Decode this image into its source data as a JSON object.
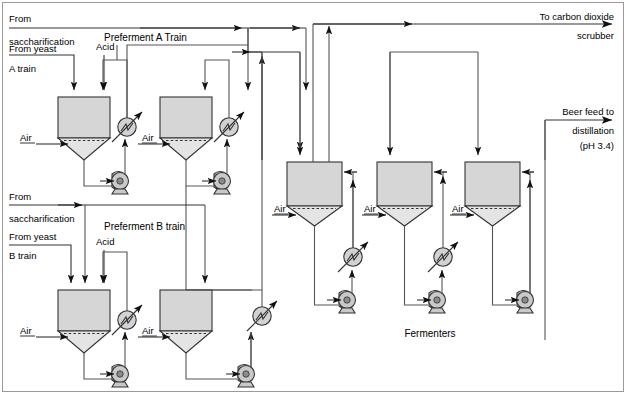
{
  "diagram": {
    "accent_color": "#d6d6d6",
    "line_color": "#555555",
    "outline_color": "#333333"
  },
  "labels": {
    "from_saccharification_a_1": "From",
    "from_saccharification_a_2": "saccharification",
    "from_yeast_a_1": "From yeast",
    "from_yeast_a_2": "A train",
    "acid_a": "Acid",
    "preferment_a_title": "Preferment A Train",
    "from_saccharification_b_1": "From",
    "from_saccharification_b_2": "saccharification",
    "from_yeast_b_1": "From yeast",
    "from_yeast_b_2": "B train",
    "acid_b": "Acid",
    "preferment_b_title": "Preferment B train",
    "to_co2_1": "To carbon dioxide",
    "to_co2_2": "scrubber",
    "beer_feed_1": "Beer feed to",
    "beer_feed_2": "distillation",
    "beer_feed_3": "(pH 3.4)",
    "fermenters": "Fermenters",
    "air": "Air"
  },
  "air_inlets": [
    {
      "id": "air-preferment-a1",
      "label": "Air"
    },
    {
      "id": "air-preferment-a2",
      "label": "Air"
    },
    {
      "id": "air-preferment-b1",
      "label": "Air"
    },
    {
      "id": "air-preferment-b2",
      "label": "Air"
    },
    {
      "id": "air-fermenter-1",
      "label": "Air"
    },
    {
      "id": "air-fermenter-2",
      "label": "Air"
    },
    {
      "id": "air-fermenter-3",
      "label": "Air"
    }
  ],
  "vessels": [
    {
      "id": "preferment-a-1",
      "kind": "preferment",
      "train": "A"
    },
    {
      "id": "preferment-a-2",
      "kind": "preferment",
      "train": "A"
    },
    {
      "id": "preferment-b-1",
      "kind": "preferment",
      "train": "B"
    },
    {
      "id": "preferment-b-2",
      "kind": "preferment",
      "train": "B"
    },
    {
      "id": "fermenter-1",
      "kind": "fermenter"
    },
    {
      "id": "fermenter-2",
      "kind": "fermenter"
    },
    {
      "id": "fermenter-3",
      "kind": "fermenter"
    }
  ],
  "equipment": {
    "heat_exchangers": 6,
    "pumps": 7
  }
}
